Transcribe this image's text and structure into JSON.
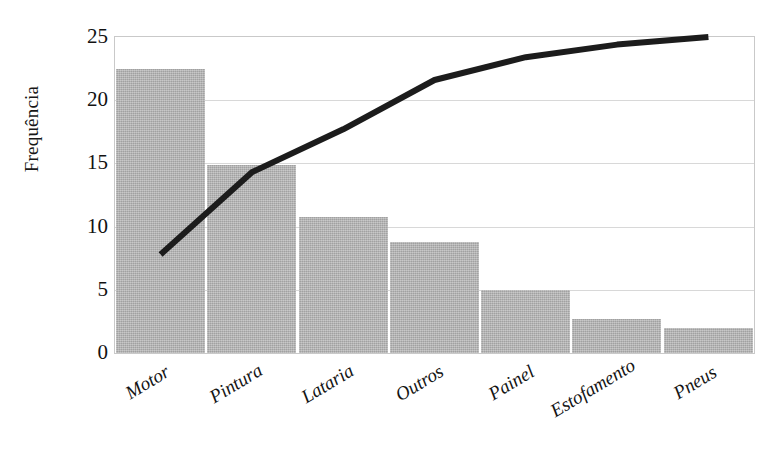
{
  "chart_data": {
    "type": "bar",
    "title": "",
    "subtitle": "",
    "xlabel": "",
    "ylabel": "Frequência",
    "categories": [
      "Motor",
      "Pintura",
      "Lataria",
      "Outros",
      "Painel",
      "Estofamento",
      "Pneus"
    ],
    "values": [
      22.5,
      14.9,
      10.8,
      8.8,
      5.0,
      2.7,
      2.0
    ],
    "series": [
      {
        "name": "Frequência",
        "type": "bar",
        "values": [
          22.5,
          14.9,
          10.8,
          8.8,
          5.0,
          2.7,
          2.0
        ]
      },
      {
        "name": "Frequência acumulada",
        "type": "line",
        "values": [
          7.8,
          14.3,
          17.7,
          21.6,
          23.4,
          24.4,
          25.0
        ]
      }
    ],
    "ylim": [
      0,
      25
    ],
    "yticks": [
      0,
      5,
      10,
      15,
      20,
      25
    ],
    "ytick_labels": [
      "0",
      "5",
      "10",
      "15",
      "20",
      "25"
    ],
    "grid": true,
    "grid_axis": "y",
    "legend": "none",
    "bar_color": "#b2b2b2",
    "line_color": "#1c1c1c",
    "axis_color": "#c9c9c9",
    "grid_color": "#d8d8d8",
    "background_color": "#ffffff",
    "xtick_rotation": -31
  }
}
